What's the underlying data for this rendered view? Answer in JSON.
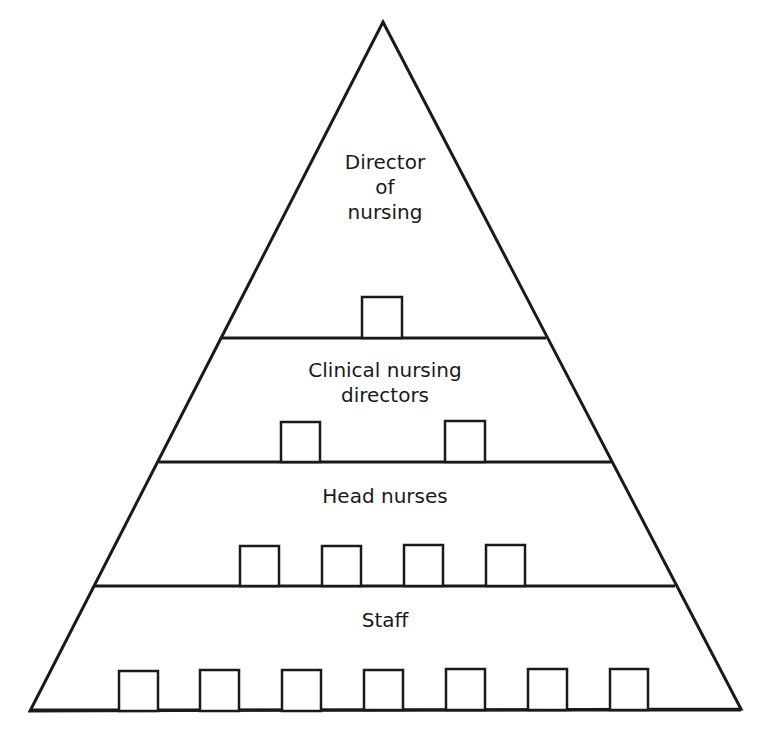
{
  "diagram": {
    "type": "org-pyramid",
    "stroke_color": "#1a1a1a",
    "background": "#ffffff",
    "apex": [
      383,
      22
    ],
    "base_left": [
      30,
      711
    ],
    "base_right": [
      741,
      709
    ],
    "tiers": [
      {
        "id": "director",
        "label": "Director\nof\nnursing",
        "label_pos": [
          385,
          150
        ],
        "divider": {
          "y": 338,
          "x1": 222,
          "x2": 546
        },
        "box_count": 1,
        "boxes": [
          {
            "x": 362,
            "y": 297,
            "w": 40,
            "h": 41
          }
        ]
      },
      {
        "id": "clinical-nursing-directors",
        "label": "Clinical nursing\ndirectors",
        "label_pos": [
          385,
          358
        ],
        "divider": {
          "y": 462,
          "x1": 159,
          "x2": 611
        },
        "box_count": 2,
        "boxes": [
          {
            "x": 281,
            "y": 422,
            "w": 39,
            "h": 40
          },
          {
            "x": 445,
            "y": 421,
            "w": 40,
            "h": 41
          }
        ]
      },
      {
        "id": "head-nurses",
        "label": "Head nurses",
        "label_pos": [
          385,
          484
        ],
        "divider": {
          "y": 586,
          "x1": 95,
          "x2": 675
        },
        "box_count": 4,
        "boxes": [
          {
            "x": 240,
            "y": 546,
            "w": 39,
            "h": 40
          },
          {
            "x": 322,
            "y": 546,
            "w": 39,
            "h": 40
          },
          {
            "x": 404,
            "y": 545,
            "w": 39,
            "h": 41
          },
          {
            "x": 486,
            "y": 545,
            "w": 39,
            "h": 41
          }
        ]
      },
      {
        "id": "staff",
        "label": "Staff",
        "label_pos": [
          385,
          608
        ],
        "divider": {
          "y": 710,
          "x1": 30,
          "x2": 741
        },
        "box_count": 7,
        "boxes": [
          {
            "x": 119,
            "y": 671,
            "w": 39,
            "h": 40
          },
          {
            "x": 200,
            "y": 670,
            "w": 39,
            "h": 41
          },
          {
            "x": 282,
            "y": 670,
            "w": 39,
            "h": 41
          },
          {
            "x": 364,
            "y": 670,
            "w": 39,
            "h": 40
          },
          {
            "x": 446,
            "y": 669,
            "w": 39,
            "h": 41
          },
          {
            "x": 528,
            "y": 669,
            "w": 39,
            "h": 41
          },
          {
            "x": 610,
            "y": 669,
            "w": 38,
            "h": 41
          }
        ]
      }
    ]
  }
}
